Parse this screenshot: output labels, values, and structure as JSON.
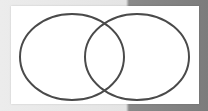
{
  "diagram": {
    "type": "venn",
    "sets_count": 2,
    "labels": [],
    "colors": {
      "stroke": "#4a4a4a",
      "panel_fill": "#ffffff",
      "background_light": "#e8e8e8",
      "background_dark": "#808080"
    },
    "sets": [
      {
        "name": "left-set",
        "cx": 72,
        "cy": 57,
        "rx": 52,
        "ry": 43
      },
      {
        "name": "right-set",
        "cx": 137,
        "cy": 57,
        "rx": 52,
        "ry": 43
      }
    ]
  }
}
